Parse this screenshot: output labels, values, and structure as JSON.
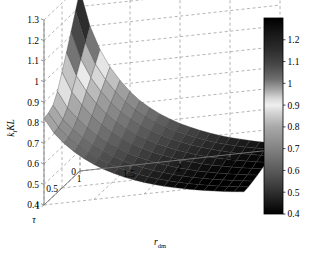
{
  "figure": {
    "type": "3d-surface-plot",
    "background": "#ffffff",
    "axis_color": "#808080",
    "grid_color": "#808080",
    "grid_style": "dashed"
  },
  "chart_data": {
    "type": "surface",
    "title": "",
    "xlabel": "r",
    "xlabel_sub": "dm",
    "ylabel": "τ",
    "zlabel": "k",
    "zlabel_sub": "i",
    "zlabel_tail": "KL",
    "xlim": [
      1,
      3
    ],
    "ylim": [
      0,
      1
    ],
    "zlim": [
      0.4,
      1.3
    ],
    "xticks": [
      "1",
      "1.5",
      "2",
      "2.5",
      "3"
    ],
    "xtick_values": [
      1,
      1.5,
      2,
      2.5,
      3
    ],
    "yticks": [
      "1",
      "0.5",
      "0"
    ],
    "ytick_values": [
      1,
      0.5,
      0
    ],
    "zticks": [
      "0.4",
      "0.5",
      "0.6",
      "0.7",
      "0.8",
      "0.9",
      "1",
      "1.1",
      "1.2",
      "1.3"
    ],
    "ztick_values": [
      0.4,
      0.5,
      0.6,
      0.7,
      0.8,
      0.9,
      1.0,
      1.1,
      1.2,
      1.3
    ],
    "grid": true,
    "legend": "none",
    "colormap": "gray-inverted-banded",
    "colorbar": {
      "position": "right",
      "orientation": "vertical",
      "vmin": 0.4,
      "vmax": 1.3,
      "ticks": [
        "1.2",
        "1.1",
        "1",
        "0.9",
        "0.8",
        "0.7",
        "0.6",
        "0.5",
        "0.4"
      ],
      "tick_values": [
        1.2,
        1.1,
        1.0,
        0.9,
        0.8,
        0.7,
        0.6,
        0.5,
        0.4
      ],
      "stops": [
        {
          "v": 1.3,
          "color": "#000000"
        },
        {
          "v": 1.22,
          "color": "#1a1a1a"
        },
        {
          "v": 1.15,
          "color": "#2e2e2e"
        },
        {
          "v": 1.08,
          "color": "#4a4a4a"
        },
        {
          "v": 1.02,
          "color": "#6e6e6e"
        },
        {
          "v": 0.97,
          "color": "#a6a6a6"
        },
        {
          "v": 0.93,
          "color": "#d8d8d8"
        },
        {
          "v": 0.9,
          "color": "#efefef"
        },
        {
          "v": 0.86,
          "color": "#d0d0d0"
        },
        {
          "v": 0.8,
          "color": "#a8a8a8"
        },
        {
          "v": 0.72,
          "color": "#8a8a8a"
        },
        {
          "v": 0.64,
          "color": "#6a6a6a"
        },
        {
          "v": 0.56,
          "color": "#4a4a4a"
        },
        {
          "v": 0.48,
          "color": "#262626"
        },
        {
          "v": 0.4,
          "color": "#000000"
        }
      ]
    },
    "x": [
      1.0,
      1.1,
      1.2,
      1.3,
      1.4,
      1.5,
      1.6,
      1.7,
      1.8,
      1.9,
      2.0,
      2.1,
      2.2,
      2.3,
      2.4,
      2.5,
      2.6,
      2.7,
      2.8,
      2.9,
      3.0
    ],
    "y": [
      0.0,
      0.125,
      0.25,
      0.375,
      0.5,
      0.625,
      0.75,
      0.875,
      1.0
    ],
    "z": [
      [
        1.28,
        1.1,
        0.98,
        0.89,
        0.82,
        0.76,
        0.71,
        0.67,
        0.635,
        0.605,
        0.578,
        0.555,
        0.534,
        0.515,
        0.498,
        0.483,
        0.47,
        0.457,
        0.446,
        0.436,
        0.427
      ],
      [
        1.2,
        1.04,
        0.93,
        0.85,
        0.785,
        0.73,
        0.685,
        0.648,
        0.615,
        0.586,
        0.561,
        0.539,
        0.519,
        0.501,
        0.485,
        0.471,
        0.458,
        0.446,
        0.436,
        0.426,
        0.418
      ],
      [
        1.12,
        0.98,
        0.885,
        0.812,
        0.752,
        0.702,
        0.66,
        0.625,
        0.594,
        0.567,
        0.544,
        0.523,
        0.504,
        0.487,
        0.472,
        0.459,
        0.446,
        0.435,
        0.425,
        0.416,
        0.408
      ],
      [
        1.04,
        0.92,
        0.84,
        0.774,
        0.719,
        0.673,
        0.634,
        0.601,
        0.572,
        0.547,
        0.525,
        0.505,
        0.488,
        0.472,
        0.458,
        0.445,
        0.434,
        0.423,
        0.414,
        0.405,
        0.398
      ],
      [
        0.965,
        0.862,
        0.793,
        0.735,
        0.686,
        0.644,
        0.608,
        0.577,
        0.55,
        0.527,
        0.506,
        0.488,
        0.471,
        0.457,
        0.443,
        0.431,
        0.421,
        0.411,
        0.402,
        0.394,
        0.387
      ],
      [
        0.892,
        0.806,
        0.748,
        0.697,
        0.653,
        0.615,
        0.583,
        0.554,
        0.529,
        0.507,
        0.488,
        0.471,
        0.455,
        0.442,
        0.429,
        0.418,
        0.408,
        0.399,
        0.391,
        0.383,
        0.377
      ],
      [
        0.845,
        0.77,
        0.716,
        0.669,
        0.629,
        0.594,
        0.563,
        0.536,
        0.513,
        0.492,
        0.474,
        0.458,
        0.443,
        0.43,
        0.418,
        0.408,
        0.398,
        0.39,
        0.382,
        0.375,
        0.368
      ],
      [
        0.828,
        0.752,
        0.698,
        0.652,
        0.612,
        0.578,
        0.549,
        0.523,
        0.5,
        0.48,
        0.463,
        0.447,
        0.433,
        0.42,
        0.409,
        0.399,
        0.39,
        0.381,
        0.374,
        0.367,
        0.361
      ],
      [
        0.822,
        0.744,
        0.689,
        0.643,
        0.604,
        0.57,
        0.541,
        0.516,
        0.493,
        0.474,
        0.456,
        0.441,
        0.427,
        0.415,
        0.404,
        0.394,
        0.385,
        0.377,
        0.369,
        0.363,
        0.357
      ]
    ]
  },
  "axes_labels": {
    "x_axis_name": "r_dm",
    "y_axis_name": "tau",
    "z_axis_name": "k_i KL"
  }
}
